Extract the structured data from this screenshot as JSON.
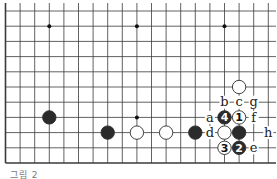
{
  "diagram": {
    "type": "go-board-fragment",
    "caption": "그림 2",
    "grid": {
      "origin_x": 5.5,
      "origin_y": 11,
      "spacing_x": 14.6,
      "spacing_y": 15.2,
      "columns": 19,
      "rows": 11,
      "left_edge": true,
      "bottom_edge": true
    },
    "star_points": [
      {
        "col": 3,
        "row": 1
      },
      {
        "col": 9,
        "row": 1
      },
      {
        "col": 15,
        "row": 1
      },
      {
        "col": 9,
        "row": 7
      }
    ],
    "stones": [
      {
        "color": "black",
        "col": 3,
        "row": 7,
        "label": ""
      },
      {
        "color": "black",
        "col": 7,
        "row": 8,
        "label": ""
      },
      {
        "color": "white",
        "col": 9,
        "row": 8,
        "label": ""
      },
      {
        "color": "white",
        "col": 11,
        "row": 8,
        "label": ""
      },
      {
        "color": "black",
        "col": 13,
        "row": 8,
        "label": ""
      },
      {
        "color": "white",
        "col": 16,
        "row": 5,
        "label": ""
      },
      {
        "color": "white",
        "col": 16,
        "row": 7,
        "label": "1"
      },
      {
        "color": "black",
        "col": 16,
        "row": 9,
        "label": "2"
      },
      {
        "color": "white",
        "col": 15,
        "row": 9,
        "label": "3"
      },
      {
        "color": "black",
        "col": 15,
        "row": 7,
        "label": "4"
      },
      {
        "color": "white",
        "col": 15,
        "row": 8,
        "label": ""
      },
      {
        "color": "black",
        "col": 16,
        "row": 8,
        "label": ""
      }
    ],
    "letters": [
      {
        "text": "a",
        "col": 14,
        "row": 7
      },
      {
        "text": "b",
        "col": 15,
        "row": 6
      },
      {
        "text": "c",
        "col": 16,
        "row": 6
      },
      {
        "text": "d",
        "col": 14,
        "row": 8
      },
      {
        "text": "e",
        "col": 17,
        "row": 9
      },
      {
        "text": "f",
        "col": 17,
        "row": 7
      },
      {
        "text": "g",
        "col": 17,
        "row": 6
      },
      {
        "text": "h",
        "col": 18,
        "row": 8
      }
    ],
    "colors": {
      "line": "#3a3a3a",
      "black_stone": "#2b2b2b",
      "white_stone": "#ffffff",
      "background": "#ffffff"
    }
  }
}
